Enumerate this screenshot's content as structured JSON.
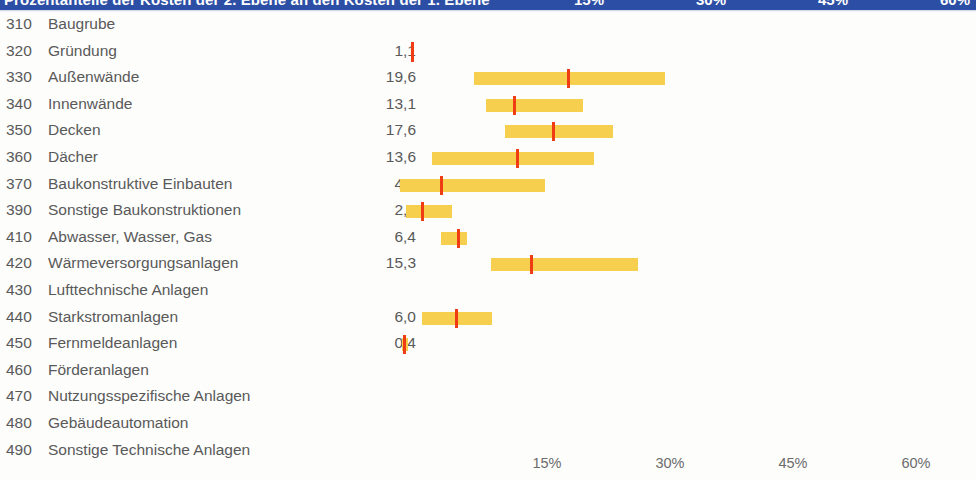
{
  "header": {
    "title": "Prozentanteile der Kosten der 2. Ebene an den Kosten der 1. Ebene",
    "tick_labels": [
      "15%",
      "30%",
      "45%",
      "60%"
    ],
    "bar_color": "#2d4ea5"
  },
  "colors": {
    "bar": "#f7cf4e",
    "marker": "#f03c12",
    "text": "#595959",
    "header": "#2d4ea5"
  },
  "axis": {
    "ticks": [
      {
        "label": "15%",
        "x": 547
      },
      {
        "label": "30%",
        "x": 670
      },
      {
        "label": "45%",
        "x": 793
      },
      {
        "label": "60%",
        "x": 916
      }
    ],
    "unit": "%",
    "origin_x": 424,
    "px_per_percent": 8.2
  },
  "chart_data": {
    "type": "bar",
    "title": "Prozentanteile der Kosten der 2. Ebene an den Kosten der 1. Ebene",
    "xlabel": "",
    "ylabel": "",
    "xlim": [
      0,
      67
    ],
    "grid": false,
    "legend": "none",
    "categories": [
      "Baugrube",
      "Gründung",
      "Außenwände",
      "Innenwände",
      "Decken",
      "Dächer",
      "Baukonstruktive Einbauten",
      "Sonstige Baukonstruktionen",
      "Abwasser, Wasser, Gas",
      "Wärmeversorgungsanlagen",
      "Lufttechnische Anlagen",
      "Starkstromanlagen",
      "Fernmeldeanlagen",
      "Förderanlagen",
      "Nutzungsspezifische Anlagen",
      "Gebäudeautomation",
      "Sonstige Technische Anlagen"
    ],
    "codes": [
      "310",
      "320",
      "330",
      "340",
      "350",
      "360",
      "370",
      "390",
      "410",
      "420",
      "430",
      "440",
      "450",
      "460",
      "470",
      "480",
      "490"
    ],
    "values": [
      null,
      1.1,
      19.6,
      13.1,
      17.6,
      13.6,
      4.6,
      2.2,
      6.4,
      15.3,
      null,
      6.0,
      0.4,
      null,
      null,
      null,
      null
    ]
  },
  "rows": [
    {
      "code": "310",
      "label": "Baugrube",
      "value": "",
      "bar": null,
      "marker": null
    },
    {
      "code": "320",
      "label": "Gründung",
      "value": "1,1",
      "bar": null,
      "marker": 411
    },
    {
      "code": "330",
      "label": "Außenwände",
      "value": "19,6",
      "bar": {
        "x": 474,
        "w": 191
      },
      "marker": 567
    },
    {
      "code": "340",
      "label": "Innenwände",
      "value": "13,1",
      "bar": {
        "x": 486,
        "w": 97
      },
      "marker": 513
    },
    {
      "code": "350",
      "label": "Decken",
      "value": "17,6",
      "bar": {
        "x": 505,
        "w": 108
      },
      "marker": 552
    },
    {
      "code": "360",
      "label": "Dächer",
      "value": "13,6",
      "bar": {
        "x": 432,
        "w": 162
      },
      "marker": 516
    },
    {
      "code": "370",
      "label": "Baukonstruktive Einbauten",
      "value": "4,6",
      "bar": {
        "x": 400,
        "w": 145
      },
      "marker": 440
    },
    {
      "code": "390",
      "label": "Sonstige Baukonstruktionen",
      "value": "2,2",
      "bar": {
        "x": 406,
        "w": 46
      },
      "marker": 421
    },
    {
      "code": "410",
      "label": "Abwasser, Wasser, Gas",
      "value": "6,4",
      "bar": {
        "x": 441,
        "w": 26
      },
      "marker": 457
    },
    {
      "code": "420",
      "label": "Wärmeversorgungsanlagen",
      "value": "15,3",
      "bar": {
        "x": 491,
        "w": 147
      },
      "marker": 530
    },
    {
      "code": "430",
      "label": "Lufttechnische Anlagen",
      "value": "",
      "bar": null,
      "marker": null
    },
    {
      "code": "440",
      "label": "Starkstromanlagen",
      "value": "6,0",
      "bar": {
        "x": 422,
        "w": 70
      },
      "marker": 455
    },
    {
      "code": "450",
      "label": "Fernmeldeanlagen",
      "value": "0,4",
      "bar": {
        "x": 402,
        "w": 6
      },
      "marker": 403
    },
    {
      "code": "460",
      "label": "Förderanlagen",
      "value": "",
      "bar": null,
      "marker": null
    },
    {
      "code": "470",
      "label": "Nutzungsspezifische Anlagen",
      "value": "",
      "bar": null,
      "marker": null
    },
    {
      "code": "480",
      "label": "Gebäudeautomation",
      "value": "",
      "bar": null,
      "marker": null
    },
    {
      "code": "490",
      "label": "Sonstige Technische Anlagen",
      "value": "",
      "bar": null,
      "marker": null
    }
  ]
}
